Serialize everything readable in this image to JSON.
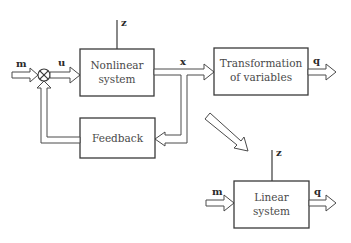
{
  "diagram": {
    "blocks": {
      "nonlinear": {
        "line1": "Nonlinear",
        "line2": "system"
      },
      "transformation": {
        "line1": "Transformation",
        "line2": "of variables"
      },
      "feedback": {
        "line1": "Feedback"
      },
      "linear": {
        "line1": "Linear",
        "line2": "system"
      }
    },
    "signals": {
      "m_top": "m",
      "u": "u",
      "z_top": "z",
      "x": "x",
      "q_top": "q",
      "z_bottom": "z",
      "m_bottom": "m",
      "q_bottom": "q"
    },
    "summing_junction": "⊗"
  }
}
